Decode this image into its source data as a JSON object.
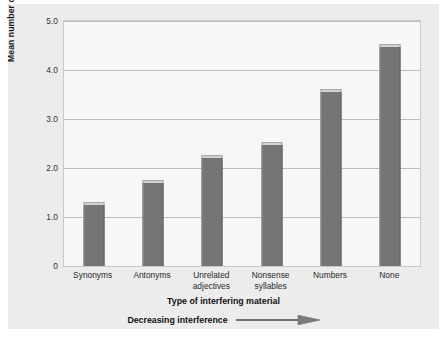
{
  "chart_data": {
    "type": "bar",
    "title": "",
    "categories": [
      "Synonyms",
      "Antonyms",
      "Unrelated adjectives",
      "Nonsense syllables",
      "Numbers",
      "None"
    ],
    "category_lines": [
      [
        "Synonyms"
      ],
      [
        "Antonyms"
      ],
      [
        "Unrelated",
        "adjectives"
      ],
      [
        "Nonsense",
        "syllables"
      ],
      [
        "Numbers"
      ],
      [
        "None"
      ]
    ],
    "values": [
      1.25,
      1.7,
      2.2,
      2.47,
      3.55,
      4.47
    ],
    "xlabel": "Type of interfering material",
    "ylabel": "Mean number of test items recalled",
    "ylim": [
      0,
      5
    ],
    "yticks": [
      0,
      1.0,
      2.0,
      3.0,
      4.0,
      5.0
    ],
    "ytick_labels": [
      "0",
      "1.0",
      "2.0",
      "3.0",
      "4.0",
      "5.0"
    ],
    "grid": true,
    "legend": "none",
    "annotation": "Decreasing interference",
    "annotation_arrow": "right-arrow",
    "bar_color": "#757575",
    "bar_cap_color": "#d3d3d3",
    "gridline_color": "#bdbdbd",
    "plot_background": "#f7f7f7",
    "figure_background": "#ececec"
  }
}
